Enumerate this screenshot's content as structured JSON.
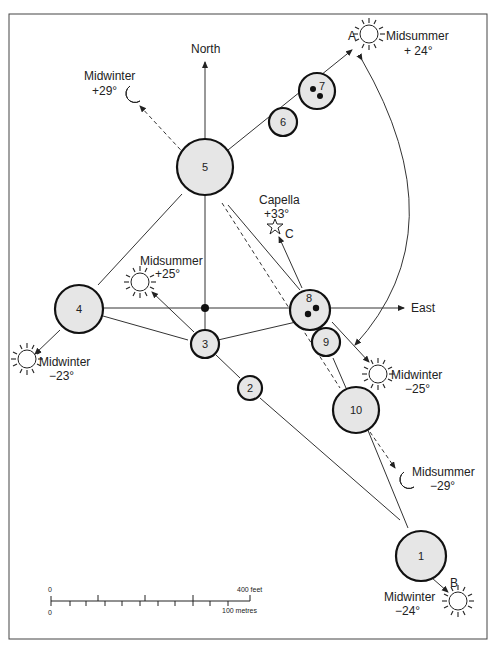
{
  "figure": {
    "directions": {
      "north": "North",
      "east": "East"
    },
    "stones": [
      {
        "id": "1",
        "label": "1"
      },
      {
        "id": "2",
        "label": "2"
      },
      {
        "id": "3",
        "label": "3"
      },
      {
        "id": "4",
        "label": "4"
      },
      {
        "id": "5",
        "label": "5"
      },
      {
        "id": "6",
        "label": "6"
      },
      {
        "id": "7",
        "label": "7"
      },
      {
        "id": "8",
        "label": "8"
      },
      {
        "id": "9",
        "label": "9"
      },
      {
        "id": "10",
        "label": "10"
      }
    ],
    "alignments": {
      "midwinter_moon_north": {
        "title": "Midwinter",
        "value": "+29°"
      },
      "midsummer_sun_ne": {
        "point": "A",
        "title": "Midsummer",
        "value": "+ 24°"
      },
      "capella": {
        "point": "C",
        "title": "Capella",
        "value": "+33°"
      },
      "midsummer_sun_nw": {
        "title": "Midsummer",
        "value": "+25°"
      },
      "midwinter_sun_sw": {
        "title": "Midwinter",
        "value": "−23°"
      },
      "midwinter_sun_se": {
        "title": "Midwinter",
        "value": "−25°"
      },
      "midsummer_moon_south": {
        "title": "Midsummer",
        "value": "−29°"
      },
      "midwinter_sun_south": {
        "point": "B",
        "title": "Midwinter",
        "value": "−24°"
      }
    },
    "scale": {
      "feet_zero": "0",
      "feet_max": "400 feet",
      "metres_zero": "0",
      "metres_max": "100 metres"
    }
  }
}
